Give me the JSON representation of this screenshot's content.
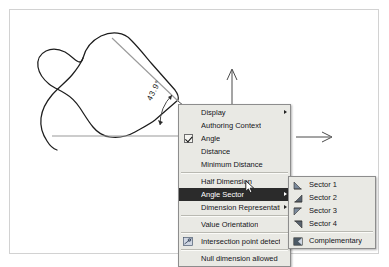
{
  "drawing": {
    "angle_value": "43.9°",
    "shape_name": "freeform-closed-spline",
    "axes": [
      {
        "name": "vertical-axis-arrow",
        "direction": "up"
      },
      {
        "name": "horizontal-axis-arrow",
        "direction": "right"
      }
    ],
    "colors": {
      "outline": "#1d1d1d",
      "dimension_line": "#9a9a9a",
      "frame": "#d2d2d2"
    }
  },
  "context_menu": {
    "items": [
      {
        "label": "Display",
        "icon": "none",
        "submenu": true,
        "checked": false,
        "highlighted": false,
        "separator_after": false
      },
      {
        "label": "Authoring Context",
        "icon": "none",
        "submenu": false,
        "checked": false,
        "highlighted": false,
        "separator_after": false
      },
      {
        "label": "Angle",
        "icon": "checkbox-icon",
        "submenu": false,
        "checked": true,
        "highlighted": false,
        "separator_after": false
      },
      {
        "label": "Distance",
        "icon": "none",
        "submenu": false,
        "checked": false,
        "highlighted": false,
        "separator_after": false
      },
      {
        "label": "Minimum Distance",
        "icon": "none",
        "submenu": false,
        "checked": false,
        "highlighted": false,
        "separator_after": true
      },
      {
        "label": "Half Dimension",
        "icon": "none",
        "submenu": false,
        "checked": false,
        "highlighted": false,
        "separator_after": false
      },
      {
        "label": "Angle Sector",
        "icon": "none",
        "submenu": true,
        "checked": false,
        "highlighted": true,
        "separator_after": false
      },
      {
        "label": "Dimension Representation",
        "icon": "none",
        "submenu": true,
        "checked": false,
        "highlighted": false,
        "separator_after": true
      },
      {
        "label": "Value Orientation",
        "icon": "none",
        "submenu": false,
        "checked": false,
        "highlighted": false,
        "separator_after": true
      },
      {
        "label": "Intersection point detection",
        "icon": "intersection-point-icon",
        "submenu": false,
        "checked": false,
        "highlighted": false,
        "separator_after": true
      },
      {
        "label": "Null dimension allowed",
        "icon": "none",
        "submenu": false,
        "checked": false,
        "highlighted": false,
        "separator_after": false
      }
    ]
  },
  "angle_sector_submenu": {
    "items": [
      {
        "label": "Sector 1",
        "icon": "sector-1-icon",
        "separator_after": false
      },
      {
        "label": "Sector 2",
        "icon": "sector-2-icon",
        "separator_after": false
      },
      {
        "label": "Sector 3",
        "icon": "sector-3-icon",
        "separator_after": false
      },
      {
        "label": "Sector 4",
        "icon": "sector-4-icon",
        "separator_after": true
      },
      {
        "label": "Complementary",
        "icon": "complementary-icon",
        "separator_after": false
      }
    ]
  }
}
